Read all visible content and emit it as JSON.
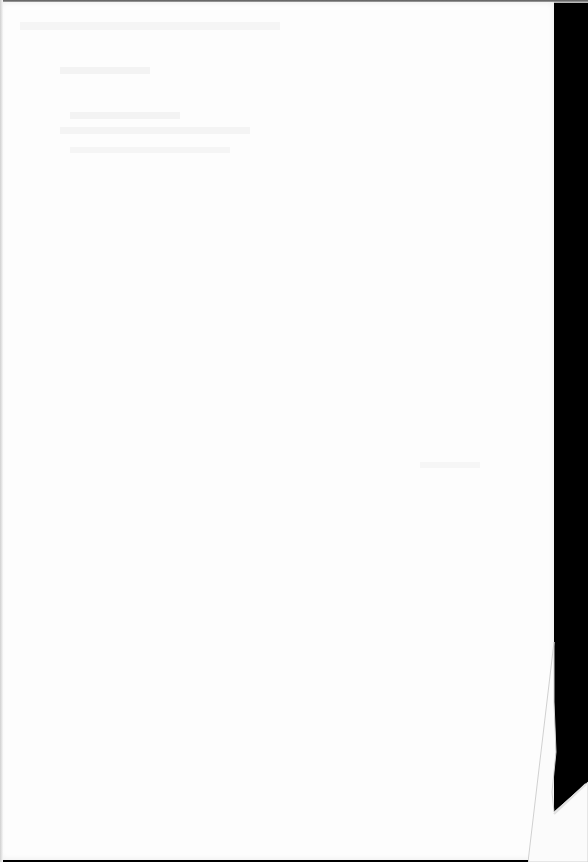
{
  "document": {
    "type": "blank scanned page",
    "visible_text": "",
    "notes": "Faint illegible show-through from reverse side only"
  },
  "colors": {
    "paper": "#fdfdfd",
    "scan_background": "#000000"
  }
}
